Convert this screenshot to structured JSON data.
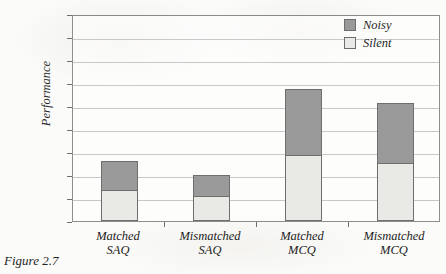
{
  "caption": "Figure 2.7",
  "chart_data": {
    "type": "bar",
    "stacked": true,
    "title": "",
    "xlabel": "",
    "ylabel": "Performance",
    "ylim": [
      0,
      45
    ],
    "yticks": [
      0,
      5,
      10,
      15,
      20,
      25,
      30,
      35,
      40,
      45
    ],
    "grid": true,
    "legend_position": "top-right",
    "categories": [
      "Matched SAQ",
      "Mismatched SAQ",
      "Matched MCQ",
      "Mismatched MCQ"
    ],
    "category_lines": [
      [
        "Matched",
        "SAQ"
      ],
      [
        "Mismatched",
        "SAQ"
      ],
      [
        "Matched",
        "MCQ"
      ],
      [
        "Mismatched",
        "MCQ"
      ]
    ],
    "series": [
      {
        "name": "Silent",
        "color": "#e9e9e6",
        "values": [
          6.8,
          5.5,
          14.3,
          12.7
        ]
      },
      {
        "name": "Noisy",
        "color": "#9a9a9a",
        "values": [
          6.2,
          4.5,
          14.5,
          12.9
        ]
      }
    ],
    "totals": [
      13.0,
      10.0,
      28.8,
      25.6
    ]
  },
  "legend": {
    "items": [
      {
        "label": "Noisy",
        "color": "#9a9a9a"
      },
      {
        "label": "Silent",
        "color": "#e9e9e6"
      }
    ]
  },
  "colors": {
    "noisy": "#9a9a9a",
    "silent": "#e9e9e6",
    "axis": "#8e8e8e",
    "grid": "#c8c8c8",
    "background": "#fbfbf9"
  }
}
